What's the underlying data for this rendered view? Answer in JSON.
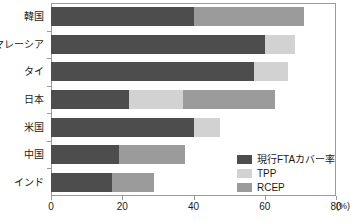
{
  "chart_data": {
    "type": "bar",
    "orientation": "horizontal",
    "stacked": true,
    "title": "",
    "xlabel": "(%)",
    "ylabel": "",
    "xlim": [
      0,
      80
    ],
    "xticks": [
      0,
      20,
      40,
      60,
      80
    ],
    "xtick_labels": [
      "0",
      "20",
      "40",
      "60",
      "80"
    ],
    "grid": false,
    "legend_position": "inside-bottom-right",
    "categories": [
      "韓国",
      "マレーシア",
      "タイ",
      "日本",
      "米国",
      "中国",
      "インド"
    ],
    "series": [
      {
        "name": "現行FTAカバー率",
        "color": "#4d4d4d",
        "values": [
          40.0,
          60.0,
          57.0,
          22.0,
          40.0,
          19.0,
          17.0
        ]
      },
      {
        "name": "TPP",
        "color": "#d2d2d2",
        "values": [
          0.0,
          8.5,
          9.5,
          15.0,
          7.5,
          0.0,
          0.0
        ]
      },
      {
        "name": "RCEP",
        "color": "#9b9b9b",
        "values": [
          31.0,
          0.0,
          0.0,
          26.0,
          0.0,
          18.5,
          12.0
        ]
      }
    ],
    "totals": [
      71.0,
      68.5,
      66.5,
      63.0,
      47.5,
      37.5,
      29.0
    ]
  },
  "axis": {
    "unit_label": "(%)"
  },
  "legend": {
    "items": [
      {
        "label": "現行FTAカバー率",
        "color": "#4d4d4d"
      },
      {
        "label": "TPP",
        "color": "#d2d2d2"
      },
      {
        "label": "RCEP",
        "color": "#9b9b9b"
      }
    ]
  }
}
